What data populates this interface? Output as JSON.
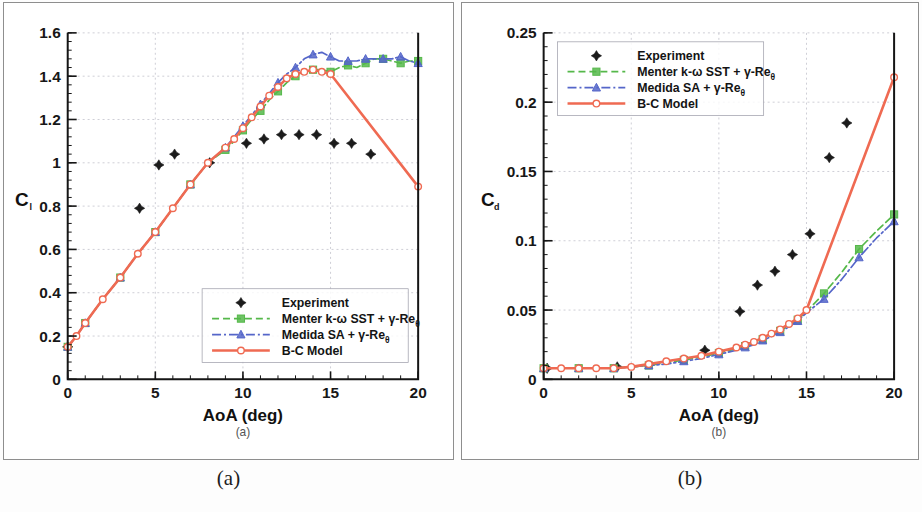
{
  "figure": {
    "caption_a": "(a)",
    "caption_b": "(b)",
    "inner_caption_a": "(a)",
    "inner_caption_b": "(b)"
  },
  "colors": {
    "experiment": "#1b1b1b",
    "menter": "#55b84a",
    "medida": "#5566c9",
    "bc_model": "#ef6a52",
    "grid": "#b9b9c4",
    "axis": "#151515",
    "panel_border": "#8e8e8e"
  },
  "legend": {
    "entries": [
      {
        "label": "Experiment",
        "style": "marker-only",
        "color_key": "experiment"
      },
      {
        "label": "Menter k-ω SST + γ-Re",
        "sub": "θ",
        "style": "dashed",
        "color_key": "menter"
      },
      {
        "label": "Medida SA + γ-Re",
        "sub": "θ",
        "style": "dash-dot",
        "color_key": "medida"
      },
      {
        "label": "B-C Model",
        "style": "solid",
        "color_key": "bc_model"
      }
    ]
  },
  "chart_data": [
    {
      "type": "line",
      "panel": "a",
      "title": "",
      "xlabel": "AoA (deg)",
      "ylabel": "C",
      "ylabel_sub": "l",
      "xlim": [
        0,
        20
      ],
      "ylim": [
        0,
        1.6
      ],
      "xticks": [
        0,
        5,
        10,
        15,
        20
      ],
      "xticklabels": [
        "0",
        "5",
        "10",
        "15",
        "20"
      ],
      "yticks": [
        0,
        0.2,
        0.4,
        0.6,
        0.8,
        1,
        1.2,
        1.4,
        1.6
      ],
      "yticklabels": [
        "0",
        "0.2",
        "0.4",
        "0.6",
        "0.8",
        "1",
        "1.2",
        "1.4",
        "1.6"
      ],
      "grid": true,
      "legend_position": "lower-right",
      "series": [
        {
          "name": "Experiment",
          "style": "marker-only",
          "color_key": "experiment",
          "x": [
            0.0,
            4.1,
            5.2,
            6.1,
            8.1,
            10.2,
            11.2,
            12.2,
            13.2,
            14.2,
            15.2,
            16.2,
            17.3
          ],
          "y": [
            0.15,
            0.79,
            0.99,
            1.04,
            1.0,
            1.09,
            1.11,
            1.13,
            1.13,
            1.13,
            1.09,
            1.09,
            1.04
          ]
        },
        {
          "name": "Menter k-ω SST + γ-Reθ",
          "style": "dashed",
          "color_key": "menter",
          "x": [
            0.0,
            0.5,
            1.0,
            2.0,
            3.0,
            4.0,
            5.0,
            6.0,
            7.0,
            8.0,
            9.0,
            9.5,
            10.0,
            10.5,
            11.0,
            11.5,
            12.0,
            12.5,
            13.0,
            13.5,
            14.0,
            14.5,
            15.0,
            15.5,
            16.0,
            16.5,
            17.0,
            17.5,
            18.0,
            18.5,
            19.0,
            19.5,
            20.0
          ],
          "y": [
            0.15,
            0.2,
            0.26,
            0.37,
            0.47,
            0.58,
            0.68,
            0.79,
            0.9,
            1.0,
            1.06,
            1.1,
            1.15,
            1.2,
            1.24,
            1.29,
            1.33,
            1.37,
            1.4,
            1.42,
            1.43,
            1.43,
            1.42,
            1.44,
            1.45,
            1.44,
            1.46,
            1.48,
            1.48,
            1.47,
            1.46,
            1.47,
            1.47
          ]
        },
        {
          "name": "Medida SA + γ-Reθ",
          "style": "dash-dot",
          "color_key": "medida",
          "x": [
            0.0,
            0.5,
            1.0,
            2.0,
            3.0,
            4.0,
            5.0,
            6.0,
            7.0,
            8.0,
            9.0,
            9.5,
            10.0,
            10.5,
            11.0,
            11.5,
            12.0,
            12.5,
            13.0,
            13.5,
            14.0,
            14.5,
            15.0,
            15.5,
            16.0,
            16.5,
            17.0,
            17.5,
            18.0,
            18.5,
            19.0,
            19.5,
            20.0
          ],
          "y": [
            0.15,
            0.2,
            0.26,
            0.37,
            0.47,
            0.58,
            0.68,
            0.79,
            0.9,
            1.0,
            1.07,
            1.12,
            1.17,
            1.22,
            1.27,
            1.32,
            1.37,
            1.41,
            1.44,
            1.48,
            1.5,
            1.51,
            1.49,
            1.47,
            1.47,
            1.47,
            1.48,
            1.48,
            1.48,
            1.48,
            1.49,
            1.47,
            1.46
          ]
        },
        {
          "name": "B-C Model",
          "style": "solid",
          "color_key": "bc_model",
          "x": [
            0.0,
            0.5,
            1.0,
            2.0,
            3.0,
            4.0,
            5.0,
            6.0,
            7.0,
            8.0,
            9.0,
            9.5,
            10.0,
            10.5,
            11.0,
            11.5,
            12.0,
            12.5,
            13.0,
            13.5,
            14.0,
            14.5,
            15.0,
            20.0
          ],
          "y": [
            0.15,
            0.2,
            0.26,
            0.37,
            0.47,
            0.58,
            0.68,
            0.79,
            0.9,
            1.0,
            1.07,
            1.11,
            1.16,
            1.21,
            1.26,
            1.31,
            1.35,
            1.39,
            1.41,
            1.42,
            1.43,
            1.42,
            1.41,
            0.89
          ]
        }
      ]
    },
    {
      "type": "line",
      "panel": "b",
      "title": "",
      "xlabel": "AoA (deg)",
      "ylabel": "C",
      "ylabel_sub": "d",
      "xlim": [
        0,
        20
      ],
      "ylim": [
        0,
        0.25
      ],
      "xticks": [
        0,
        5,
        10,
        15,
        20
      ],
      "xticklabels": [
        "0",
        "5",
        "10",
        "15",
        "20"
      ],
      "yticks": [
        0,
        0.05,
        0.1,
        0.15,
        0.2,
        0.25
      ],
      "yticklabels": [
        "0",
        "0.05",
        "0.1",
        "0.15",
        "0.2",
        "0.25"
      ],
      "grid": true,
      "legend_position": "upper-left",
      "series": [
        {
          "name": "Experiment",
          "style": "marker-only",
          "color_key": "experiment",
          "x": [
            0.2,
            4.2,
            9.2,
            11.2,
            12.2,
            13.2,
            14.2,
            15.2,
            16.3,
            17.3
          ],
          "y": [
            0.008,
            0.009,
            0.021,
            0.049,
            0.068,
            0.078,
            0.09,
            0.105,
            0.16,
            0.185
          ]
        },
        {
          "name": "Menter k-ω SST + γ-Reθ",
          "style": "dashed",
          "color_key": "menter",
          "x": [
            0.0,
            1.0,
            2.0,
            3.0,
            4.0,
            5.0,
            6.0,
            7.0,
            8.0,
            9.0,
            10.0,
            11.0,
            11.5,
            12.0,
            12.5,
            13.0,
            13.5,
            14.0,
            14.5,
            15.0,
            16.0,
            17.0,
            18.0,
            19.0,
            20.0
          ],
          "y": [
            0.008,
            0.008,
            0.008,
            0.008,
            0.008,
            0.009,
            0.01,
            0.012,
            0.014,
            0.016,
            0.019,
            0.022,
            0.024,
            0.026,
            0.029,
            0.032,
            0.035,
            0.039,
            0.043,
            0.049,
            0.062,
            0.077,
            0.094,
            0.107,
            0.119
          ]
        },
        {
          "name": "Medida SA + γ-Reθ",
          "style": "dash-dot",
          "color_key": "medida",
          "x": [
            0.0,
            1.0,
            2.0,
            3.0,
            4.0,
            5.0,
            6.0,
            7.0,
            8.0,
            9.0,
            10.0,
            11.0,
            11.5,
            12.0,
            12.5,
            13.0,
            13.5,
            14.0,
            14.5,
            15.0,
            16.0,
            17.0,
            18.0,
            19.0,
            20.0
          ],
          "y": [
            0.008,
            0.008,
            0.008,
            0.008,
            0.008,
            0.009,
            0.01,
            0.011,
            0.013,
            0.015,
            0.018,
            0.021,
            0.023,
            0.025,
            0.028,
            0.031,
            0.034,
            0.038,
            0.042,
            0.048,
            0.058,
            0.072,
            0.088,
            0.102,
            0.114
          ]
        },
        {
          "name": "B-C Model",
          "style": "solid",
          "color_key": "bc_model",
          "x": [
            0.0,
            1.0,
            2.0,
            3.0,
            4.0,
            5.0,
            6.0,
            7.0,
            8.0,
            9.0,
            10.0,
            11.0,
            11.5,
            12.0,
            12.5,
            13.0,
            13.5,
            14.0,
            14.5,
            15.0,
            20.0
          ],
          "y": [
            0.008,
            0.008,
            0.008,
            0.008,
            0.008,
            0.009,
            0.011,
            0.013,
            0.015,
            0.017,
            0.02,
            0.023,
            0.025,
            0.027,
            0.03,
            0.033,
            0.036,
            0.04,
            0.044,
            0.05,
            0.218
          ]
        }
      ]
    }
  ]
}
